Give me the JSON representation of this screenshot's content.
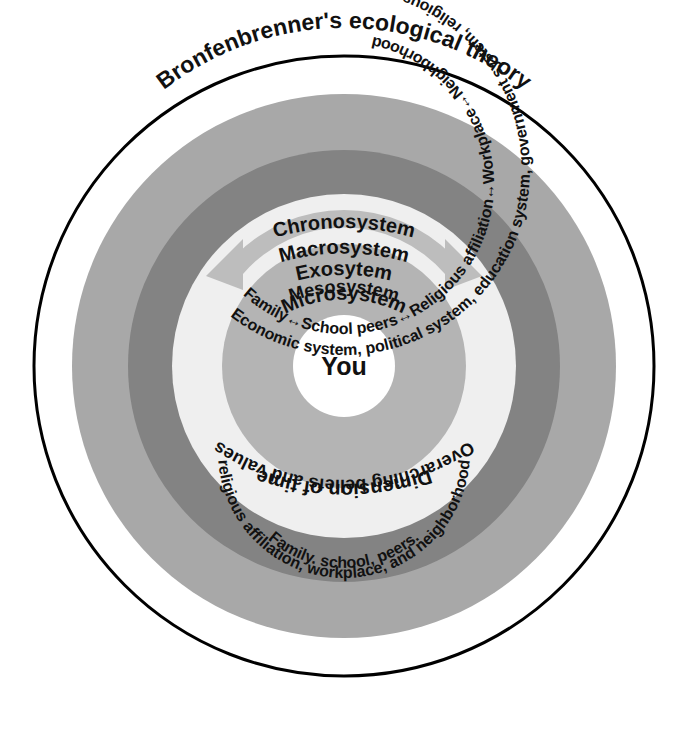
{
  "diagram": {
    "title": "Bronfenbrenner's ecological theory",
    "center_label": "You",
    "colors": {
      "background": "#ffffff",
      "outline": "#000000",
      "chronosystem_fill": "#ffffff",
      "macrosystem_fill": "#a8a8a8",
      "exosystem_fill": "#838383",
      "mesosystem_fill": "#efefef",
      "microsystem_fill": "#b4b4b4",
      "core_fill": "#ffffff",
      "arrow_fill": "#bdbdbd",
      "text": "#111111"
    },
    "rings": [
      {
        "id": "chronosystem",
        "name": "Chronosystem",
        "label": "Chronosystem",
        "description": "Dimension of time",
        "fill": "#ffffff",
        "order": 1
      },
      {
        "id": "macrosystem",
        "name": "Macrosystem",
        "label": "Macrosystem",
        "description": "Overarching beliefs and values",
        "fill": "#a8a8a8",
        "order": 2
      },
      {
        "id": "exosystem",
        "name": "Exosystem",
        "label": "Exosytem",
        "description": "Economic system, political system, education system, government system, religious system",
        "fill": "#838383",
        "order": 3
      },
      {
        "id": "mesosystem",
        "name": "Mesosystem",
        "label": "Mesosystem",
        "description_left": "Family",
        "description_left2": "School peers",
        "description_bottom": "Religious affiliation",
        "description_right2": "Workplace",
        "description_right": "Neighborhood",
        "fill": "#efefef",
        "order": 4
      },
      {
        "id": "microsystem",
        "name": "Microsystem",
        "label": "Microsystem",
        "description_top": "Family. school, peers.",
        "description_bottom": "religious affiliation, workplace, and neighborhood",
        "fill": "#b4b4b4",
        "order": 5
      }
    ],
    "mesosystem_chain": [
      "Family",
      "School peers",
      "Religious affiliation",
      "Workplace",
      "Neighborhood"
    ],
    "arrow_glyph": "double-headed-arrow"
  }
}
